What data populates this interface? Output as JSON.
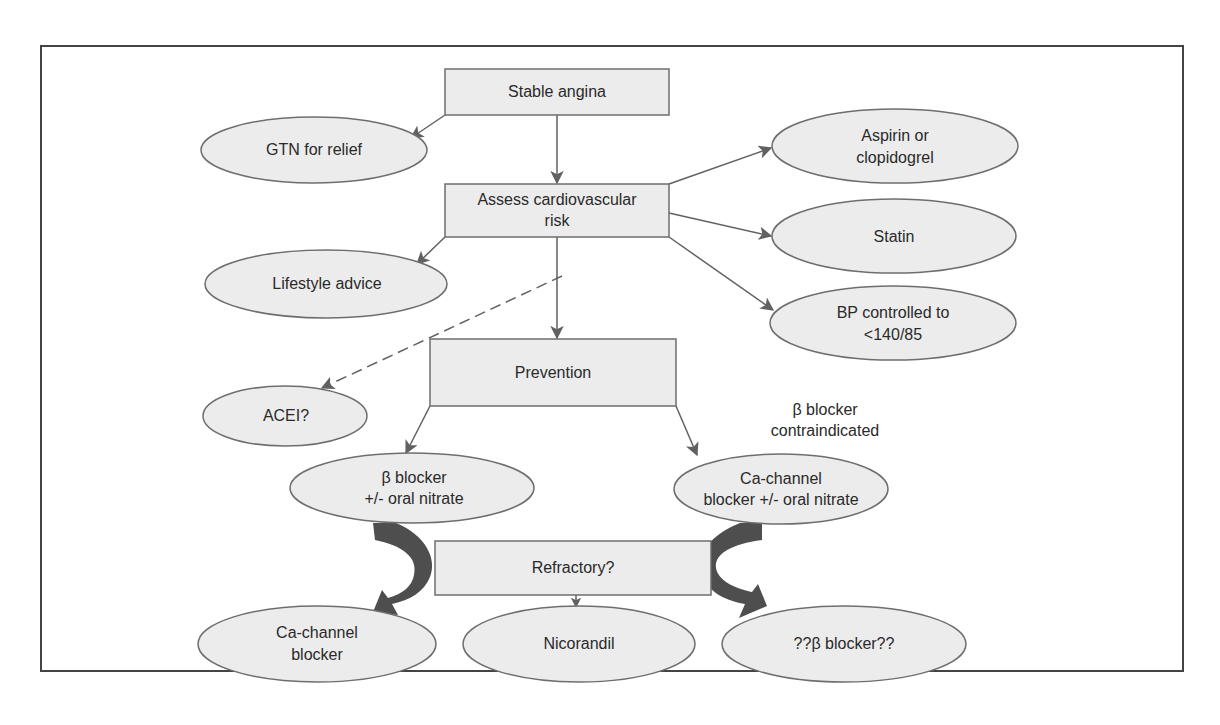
{
  "figure": {
    "frame": {
      "x": 41,
      "y": 46,
      "width": 1142,
      "height": 625,
      "stroke": "#444444"
    },
    "colors": {
      "node_fill": "#ececec",
      "node_stroke": "#6e6e6e",
      "edge": "#616161",
      "thick_arrow": "#4e4e4e",
      "text": "#2a2a2a"
    }
  },
  "nodes": {
    "stable_angina": {
      "shape": "box",
      "lines": [
        "Stable angina"
      ]
    },
    "assess_cv_risk": {
      "shape": "box",
      "lines": [
        "Assess cardiovascular",
        "risk"
      ]
    },
    "prevention": {
      "shape": "box",
      "lines": [
        "Prevention"
      ]
    },
    "refractory": {
      "shape": "box",
      "lines": [
        "Refractory?"
      ]
    },
    "gtn_relief": {
      "shape": "ellipse",
      "lines": [
        "GTN for relief"
      ]
    },
    "lifestyle_advice": {
      "shape": "ellipse",
      "lines": [
        "Lifestyle advice"
      ]
    },
    "acei": {
      "shape": "ellipse",
      "lines": [
        "ACEI?"
      ]
    },
    "aspirin_clopidogrel": {
      "shape": "ellipse",
      "lines": [
        "Aspirin or",
        "clopidogrel"
      ]
    },
    "statin": {
      "shape": "ellipse",
      "lines": [
        "Statin"
      ]
    },
    "bp_controlled": {
      "shape": "ellipse",
      "lines": [
        "BP controlled to",
        "<140/85"
      ]
    },
    "beta_blocker_nitrate": {
      "shape": "ellipse",
      "lines": [
        "β blocker",
        "+/- oral nitrate"
      ]
    },
    "ca_blocker_nitrate": {
      "shape": "ellipse",
      "lines": [
        "Ca-channel",
        "blocker +/- oral nitrate"
      ]
    },
    "ca_channel_blocker": {
      "shape": "ellipse",
      "lines": [
        "Ca-channel",
        "blocker"
      ]
    },
    "nicorandil": {
      "shape": "ellipse",
      "lines": [
        "Nicorandil"
      ]
    },
    "beta_blocker_q": {
      "shape": "ellipse",
      "lines": [
        "??β blocker??"
      ]
    }
  },
  "annotations": {
    "beta_contraindicated": {
      "lines": [
        "β blocker",
        "contraindicated"
      ]
    }
  },
  "edges": [
    {
      "from": "stable_angina",
      "to": "gtn_relief",
      "style": "solid"
    },
    {
      "from": "stable_angina",
      "to": "assess_cv_risk",
      "style": "solid"
    },
    {
      "from": "assess_cv_risk",
      "to": "lifestyle_advice",
      "style": "solid"
    },
    {
      "from": "assess_cv_risk",
      "to": "aspirin_clopidogrel",
      "style": "solid"
    },
    {
      "from": "assess_cv_risk",
      "to": "statin",
      "style": "solid"
    },
    {
      "from": "assess_cv_risk",
      "to": "bp_controlled",
      "style": "solid"
    },
    {
      "from": "assess_cv_risk",
      "to": "prevention",
      "style": "solid"
    },
    {
      "from": "assess_cv_risk",
      "to": "acei",
      "style": "dashed"
    },
    {
      "from": "prevention",
      "to": "beta_blocker_nitrate",
      "style": "solid"
    },
    {
      "from": "prevention",
      "to": "ca_blocker_nitrate",
      "style": "solid"
    },
    {
      "from": "beta_blocker_nitrate",
      "to": "ca_channel_blocker",
      "style": "thick-curved"
    },
    {
      "from": "ca_blocker_nitrate",
      "to": "beta_blocker_q",
      "style": "thick-curved"
    },
    {
      "from": "refractory",
      "to": "nicorandil",
      "style": "solid"
    }
  ],
  "caption": {
    "visible": "partially cut off at bottom edge (unreadable)"
  }
}
